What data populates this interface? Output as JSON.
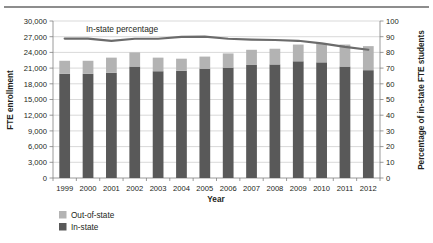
{
  "chart_data": {
    "type": "bar",
    "title": "",
    "subtitle": "",
    "xlabel": "Year",
    "ylabel": "FTE enrollment",
    "ylabel_right": "Percentage of in-state FTE students",
    "categories": [
      "1999",
      "2000",
      "2001",
      "2002",
      "2003",
      "2004",
      "2005",
      "2006",
      "2007",
      "2008",
      "2009",
      "2010",
      "2011",
      "2012"
    ],
    "ylim": [
      0,
      30000
    ],
    "yticks": [
      "0",
      "3,000",
      "6,000",
      "9,000",
      "12,000",
      "15,000",
      "18,000",
      "21,000",
      "24,000",
      "27,000",
      "30,000"
    ],
    "ytick_values": [
      0,
      3000,
      6000,
      9000,
      12000,
      15000,
      18000,
      21000,
      24000,
      27000,
      30000
    ],
    "ylim_right": [
      0,
      100
    ],
    "yticks_right": [
      "0",
      "10",
      "20",
      "30",
      "40",
      "50",
      "60",
      "70",
      "80",
      "90",
      "100"
    ],
    "ytick_values_right": [
      0,
      10,
      20,
      30,
      40,
      50,
      60,
      70,
      80,
      90,
      100
    ],
    "grid": true,
    "stacked": true,
    "legend_position": "bottom-left",
    "series": [
      {
        "name": "In-state",
        "type": "bar",
        "color": "#595959",
        "axis": "left",
        "values": [
          19900,
          19900,
          20100,
          21300,
          20400,
          20500,
          20900,
          21100,
          21600,
          21700,
          22300,
          22100,
          21300,
          20600
        ]
      },
      {
        "name": "Out-of-state",
        "type": "bar",
        "color": "#b3b3b3",
        "axis": "left",
        "values": [
          2500,
          2500,
          2900,
          2700,
          2600,
          2300,
          2300,
          2700,
          2900,
          3000,
          3200,
          3700,
          4200,
          4600
        ]
      },
      {
        "name": "In-state percentage",
        "type": "line",
        "color": "#6b6b6b",
        "axis": "right",
        "values": [
          88.8,
          88.8,
          87.4,
          88.7,
          88.7,
          89.9,
          90.1,
          88.7,
          88.2,
          87.9,
          87.4,
          85.7,
          83.5,
          81.7
        ]
      }
    ],
    "annotations": [
      {
        "text": "In-state percentage",
        "x": 1.6,
        "y": 98
      }
    ]
  },
  "legend": {
    "items": [
      {
        "label": "Out-of-state",
        "color": "#b3b3b3"
      },
      {
        "label": "In-state",
        "color": "#595959"
      }
    ]
  }
}
